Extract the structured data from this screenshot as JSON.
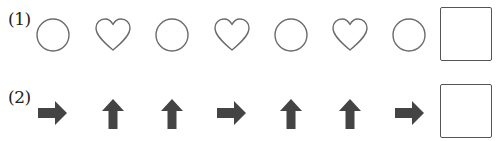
{
  "rows": [
    {
      "label": "(1)",
      "sequence": [
        "circle",
        "heart",
        "circle",
        "heart",
        "circle",
        "heart",
        "circle"
      ],
      "answer": ""
    },
    {
      "label": "(2)",
      "sequence": [
        "arrow-right",
        "arrow-up",
        "arrow-up",
        "arrow-right",
        "arrow-up",
        "arrow-up",
        "arrow-right"
      ],
      "answer": ""
    }
  ],
  "colors": {
    "outline": "#6b6b6b",
    "arrow_fill": "#444444",
    "box_border": "#555555"
  }
}
